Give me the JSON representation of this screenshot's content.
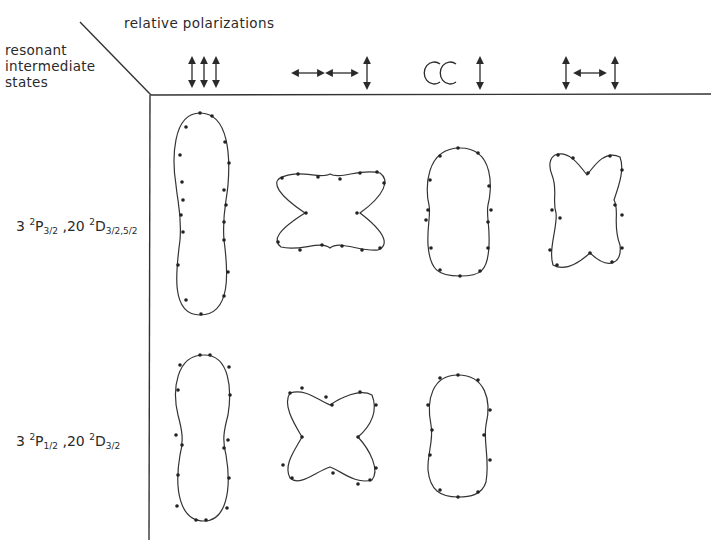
{
  "figure": {
    "corner_label": {
      "lines": [
        "resonant",
        "intermediate",
        "states"
      ]
    },
    "column_header_title": "relative polarizations",
    "columns": [
      {
        "id": "col1",
        "symbol": "↕↕↕",
        "description": "three parallel vertical (linear) polarizations"
      },
      {
        "id": "col2",
        "symbol": "↔↔↕",
        "description": "two horizontal linear, one vertical"
      },
      {
        "id": "col3",
        "symbol": "CC↕",
        "description": "two circular, one vertical linear"
      },
      {
        "id": "col4",
        "symbol": "↕↔↕",
        "description": "vertical, horizontal, vertical"
      }
    ],
    "rows": [
      {
        "id": "row1",
        "label": {
          "n1": "3",
          "term1_sup": "2",
          "term1": "P",
          "term1_sub": "3/2",
          "sep": ",20",
          "term2_sup": "2",
          "term2": "D",
          "term2_sub": "3/2,5/2"
        },
        "label_text": "3 2P3/2 ,20 2D3/2,5/2",
        "patterns": [
          "peanut-vertical-elongated",
          "butterfly-horizontal",
          "oval-vertical",
          "butterfly-vertical"
        ]
      },
      {
        "id": "row2",
        "label": {
          "n1": "3",
          "term1_sup": "2",
          "term1": "P",
          "term1_sub": "1/2",
          "sep": ",20",
          "term2_sup": "2",
          "term2": "D",
          "term2_sub": "3/2"
        },
        "label_text": "3 2P1/2 ,20 2D3/2",
        "patterns": [
          "peanut-vertical",
          "four-lobe-cross",
          "peanut-vertical-short",
          null
        ]
      }
    ],
    "colors": {
      "ink": "#2a2a2a",
      "background": "#ffffff"
    }
  }
}
